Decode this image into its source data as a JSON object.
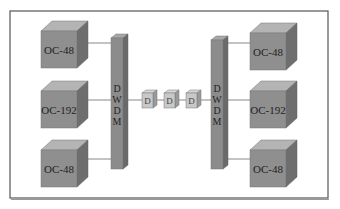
{
  "diagram": {
    "left_nodes": [
      {
        "label": "OC-48"
      },
      {
        "label": "OC-192"
      },
      {
        "label": "OC-48"
      }
    ],
    "right_nodes": [
      {
        "label": "OC-48"
      },
      {
        "label": "OC-192"
      },
      {
        "label": "OC-48"
      }
    ],
    "left_mux": {
      "letters": [
        "D",
        "W",
        "D",
        "M"
      ]
    },
    "right_mux": {
      "letters": [
        "D",
        "W",
        "D",
        "M"
      ]
    },
    "amplifiers": [
      {
        "glyph": "D"
      },
      {
        "glyph": "D"
      },
      {
        "glyph": "D"
      }
    ],
    "colors": {
      "cube_front": "#8f8f8f",
      "cube_top": "#b4b4b4",
      "cube_side": "#6e6e6e",
      "amp_front": "#c8c8c8",
      "frame": "#555555",
      "link": "#888888"
    }
  }
}
